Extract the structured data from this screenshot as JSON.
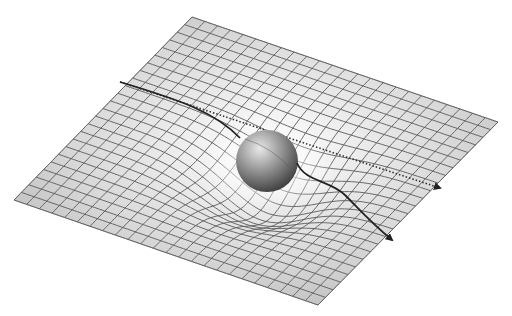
{
  "diagram": {
    "title": "",
    "sheet": {
      "corners": {
        "top": [
          192,
          17
        ],
        "right": [
          498,
          122
        ],
        "bottom": [
          318,
          305
        ],
        "left": [
          14,
          200
        ]
      },
      "grid_divisions": 24,
      "fill_light": "#f4f4f4",
      "fill_dark": "#b8b8b8",
      "grid_color": "#5a5a5a"
    },
    "mass": {
      "label": "",
      "center": [
        267,
        161
      ],
      "radius": 31,
      "highlight": "#e6e6e6",
      "shadow": "#3a3a3a"
    },
    "paths": [
      {
        "name": "undeflected-path",
        "style": "dotted",
        "color": "#333333",
        "from": [
          120,
          82
        ],
        "to": [
          440,
          188
        ]
      },
      {
        "name": "deflected-path",
        "style": "solid",
        "color": "#222222",
        "from": [
          120,
          82
        ],
        "to": [
          392,
          240
        ]
      }
    ],
    "text_labels": []
  }
}
